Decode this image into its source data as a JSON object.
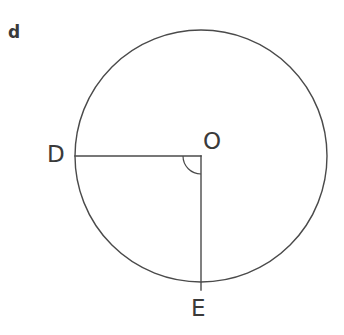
{
  "figure": {
    "part_label": "d",
    "background_color": "#ffffff",
    "stroke_color": "#4a4a4a",
    "label_color": "#3a3a3a",
    "circle": {
      "center_x": 201,
      "center_y": 156,
      "radius": 126,
      "stroke_width": 1.4
    },
    "points": [
      {
        "name": "D",
        "label": "D",
        "x": 75,
        "y": 156
      },
      {
        "name": "O",
        "label": "O",
        "x": 201,
        "y": 156
      },
      {
        "name": "E",
        "label": "E",
        "x": 201,
        "y": 282
      }
    ],
    "segments": [
      {
        "name": "radius-OD",
        "from": "O",
        "to": "D",
        "x1": 201,
        "y1": 156,
        "x2": 75,
        "y2": 156
      },
      {
        "name": "radius-OE",
        "from": "O",
        "to": "E",
        "x1": 201,
        "y1": 156,
        "x2": 201,
        "y2": 290
      }
    ],
    "angle_marker": {
      "name": "right-angle-arc-DOE",
      "vertex": "O",
      "measure": "90",
      "radius": 18,
      "start_deg": 90,
      "end_deg": 180
    }
  }
}
